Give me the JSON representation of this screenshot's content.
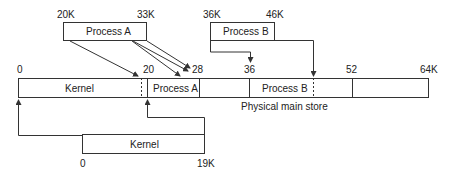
{
  "diagram": {
    "caption": "Physical main store",
    "virtual_segments": {
      "process_a": {
        "label": "Process A",
        "start": "20K",
        "end": "33K"
      },
      "process_b": {
        "label": "Process B",
        "start": "36K",
        "end": "46K"
      },
      "kernel": {
        "label": "Kernel",
        "start": "0",
        "end": "19K"
      }
    },
    "main_store": {
      "ticks": [
        "0",
        "20",
        "28",
        "36",
        "52",
        "64K"
      ],
      "regions": [
        {
          "label": "Kernel"
        },
        {
          "label": "Process A"
        },
        {
          "label": ""
        },
        {
          "label": "Process B"
        },
        {
          "label": ""
        }
      ]
    },
    "colors": {
      "line": "#333333",
      "background": "#ffffff"
    }
  }
}
